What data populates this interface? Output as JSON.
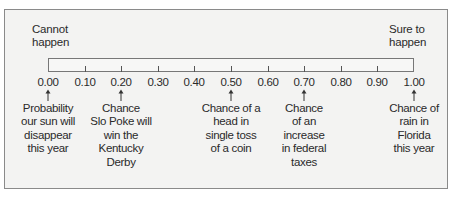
{
  "chart_data": {
    "type": "diagram",
    "title": "",
    "scale": {
      "min": 0.0,
      "max": 1.0,
      "step": 0.1,
      "tick_labels": [
        "0.00",
        "0.10",
        "0.20",
        "0.30",
        "0.40",
        "0.50",
        "0.60",
        "0.70",
        "0.80",
        "0.90",
        "1.00"
      ]
    },
    "end_labels": {
      "left": [
        "Cannot",
        "happen"
      ],
      "right": [
        "Sure to",
        "happen"
      ]
    },
    "annotations": [
      {
        "value": 0.0,
        "lines": [
          "Probability",
          "our sun will",
          "disappear",
          "this year"
        ]
      },
      {
        "value": 0.2,
        "lines": [
          "Chance",
          "Slo Poke will",
          "win the",
          "Kentucky",
          "Derby"
        ]
      },
      {
        "value": 0.5,
        "lines": [
          "Chance of a",
          "head in",
          "single toss",
          "of a coin"
        ]
      },
      {
        "value": 0.7,
        "lines": [
          "Chance",
          "of an",
          "increase",
          "in federal",
          "taxes"
        ]
      },
      {
        "value": 1.0,
        "lines": [
          "Chance of",
          "rain in",
          "Florida",
          "this year"
        ]
      }
    ]
  },
  "colors": {
    "background": "#f3f3f2",
    "frame": "#8a8a8a",
    "text": "#2a2a2a"
  }
}
